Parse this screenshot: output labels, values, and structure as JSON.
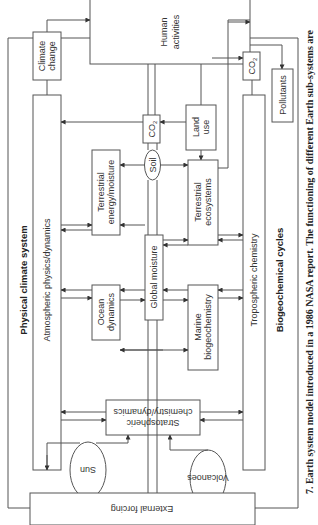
{
  "diagram": {
    "groups": {
      "physical_climate_system": "Physical climate system",
      "biogeochemical_cycles": "Biogeochemical cycles"
    },
    "nodes": {
      "human_activities": [
        "Human",
        "activities"
      ],
      "climate_change": [
        "Climate",
        "change"
      ],
      "co2_left": "CO",
      "co2_left_sub": "2",
      "co2_right": "CO",
      "co2_right_sub": "2",
      "land_use": [
        "Land",
        "use"
      ],
      "pollutants": "Pollutants",
      "atmospheric": "Atmospheric physics/dynamics",
      "tropospheric": "Tropospheric chemistry",
      "soil": "Soil",
      "terrestrial_energy": [
        "Terrestrial",
        "energy/moisture"
      ],
      "terrestrial_ecosystems": [
        "Terrestrial",
        "ecosystems"
      ],
      "global_moisture": "Global moisture",
      "ocean_dynamics": [
        "Ocean",
        "dynamics"
      ],
      "marine_biogeochemistry": [
        "Marine",
        "biogeochemistry"
      ],
      "stratospheric": [
        "Stratospheric",
        "chemistry/dynamics"
      ],
      "sun": "Sun",
      "volcanoes": "Volcanoes",
      "external_forcing": "External forcing"
    },
    "caption": "7.  Earth system model introduced in a 1986 NASA report. The functioning of different Earth sub-systems are"
  }
}
